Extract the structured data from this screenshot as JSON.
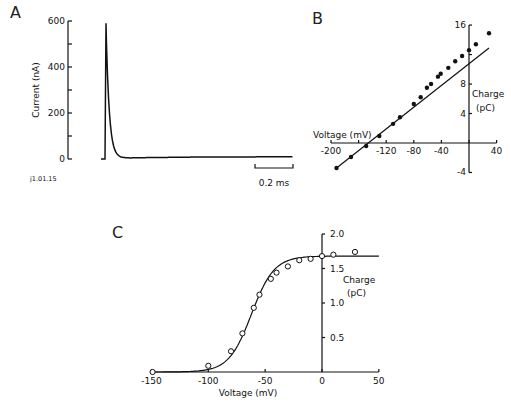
{
  "chart_data": [
    {
      "panel": "A",
      "type": "line",
      "title": "",
      "xlabel": "",
      "ylabel": "Current (nA)",
      "yticks": [
        "0",
        "200",
        "400",
        "600"
      ],
      "ytick_values": [
        0,
        200,
        400,
        600
      ],
      "ylim": [
        0,
        600
      ],
      "scale_bar_label": "0.2 ms",
      "annotation": "j1.01.15",
      "series": [
        {
          "name": "current",
          "x_ms": [
            0,
            0.02,
            0.03,
            0.04,
            0.06,
            0.08,
            0.12,
            0.17,
            0.25,
            0.4,
            0.7,
            1.0
          ],
          "y": [
            0,
            0,
            590,
            360,
            170,
            90,
            30,
            12,
            5,
            5,
            8,
            10
          ]
        }
      ]
    },
    {
      "panel": "B",
      "type": "scatter",
      "title": "",
      "xlabel": "Voltage (mV)",
      "ylabel": "Charge (pC)",
      "xticks": [
        "-200",
        "-120",
        "-80",
        "-40",
        "40"
      ],
      "xtick_values": [
        -200,
        -160,
        -120,
        -80,
        -40,
        0,
        40
      ],
      "xtick_labeled": [
        -200,
        -120,
        -80,
        -40,
        40
      ],
      "yticks": [
        "-4",
        "4",
        "8",
        "16"
      ],
      "ytick_values": [
        -4,
        4,
        8,
        12,
        16
      ],
      "ytick_labeled": [
        -4,
        4,
        8,
        16
      ],
      "xlim": [
        -200,
        40
      ],
      "ylim": [
        -4,
        16
      ],
      "series": [
        {
          "name": "measured",
          "x": [
            -192,
            -171,
            -149,
            -130,
            -110,
            -100,
            -80,
            -70,
            -61,
            -55,
            -45,
            -41,
            -30,
            -20,
            -10,
            0,
            10,
            29
          ],
          "y": [
            -3.4,
            -1.9,
            -0.4,
            0.95,
            2.6,
            3.5,
            5.3,
            6.2,
            7.5,
            8.0,
            9.0,
            9.4,
            10.2,
            11.1,
            11.8,
            12.6,
            13.4,
            14.9
          ]
        },
        {
          "name": "linear fit",
          "type": "line",
          "x": [
            -192,
            29
          ],
          "y": [
            -3.4,
            12.9
          ]
        }
      ]
    },
    {
      "panel": "C",
      "type": "scatter",
      "title": "",
      "xlabel": "Voltage (mV)",
      "ylabel": "Charge (pC)",
      "xticks": [
        "-150",
        "-100",
        "-50",
        "0",
        "50"
      ],
      "xtick_values": [
        -150,
        -100,
        -50,
        0,
        50
      ],
      "yticks": [
        "0.5",
        "1.0",
        "1.5",
        "2.0"
      ],
      "ytick_values": [
        0.5,
        1.0,
        1.5,
        2.0
      ],
      "xlim": [
        -150,
        50
      ],
      "ylim": [
        0,
        2.0
      ],
      "series": [
        {
          "name": "measured",
          "x": [
            -149,
            -100,
            -80,
            -70,
            -60,
            -55,
            -45,
            -40,
            -30,
            -20,
            -10,
            0,
            10,
            29
          ],
          "y": [
            0,
            0.09,
            0.3,
            0.56,
            0.93,
            1.12,
            1.35,
            1.44,
            1.53,
            1.62,
            1.64,
            1.68,
            1.7,
            1.74
          ]
        },
        {
          "name": "Boltzmann fit",
          "type": "line",
          "qmax": 1.68,
          "v_half": -62,
          "slope_k": 10
        }
      ]
    }
  ],
  "labels": {
    "panel_a": "A",
    "panel_b": "B",
    "panel_c": "C",
    "a_ylabel": "Current (nA)",
    "a_scale": "0.2 ms",
    "a_id": "j1.01.15",
    "b_xlabel": "Voltage (mV)",
    "b_ylabel1": "Charge",
    "b_ylabel2": "(pC)",
    "c_xlabel": "Voltage (mV)",
    "c_ylabel1": "Charge",
    "c_ylabel2": "(pC)"
  }
}
